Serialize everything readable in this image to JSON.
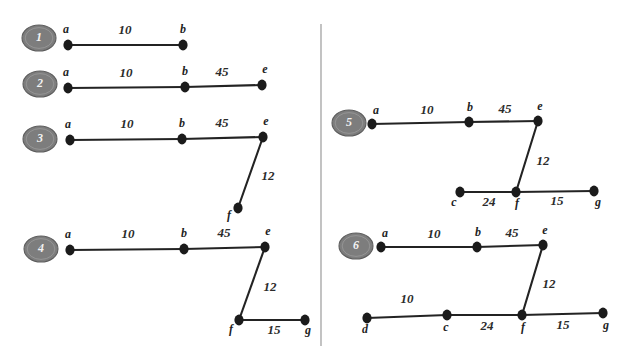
{
  "figure": {
    "background_color": "#ffffff",
    "edge_color": "#232323",
    "node_color": "#1b1b1b",
    "badge_fill": "#7d7d7d",
    "badge_text_color": "#f2f2f2",
    "divider_color": "#9a9a9a"
  },
  "divider": {
    "x": 321,
    "y1": 24,
    "y2": 346
  },
  "panels": [
    {
      "id": "panel-1",
      "badge": {
        "label": "1",
        "cx": 39,
        "cy": 38,
        "rx": 17,
        "ry": 13
      },
      "nodes": [
        {
          "id": "a",
          "label": "a",
          "x": 68,
          "y": 45,
          "label_dx": -2,
          "label_dy": -12
        },
        {
          "id": "b",
          "label": "b",
          "x": 183,
          "y": 45,
          "label_dx": 0,
          "label_dy": -12
        }
      ],
      "edges": [
        {
          "from": "a",
          "to": "b",
          "weight": "10",
          "label_x": 125,
          "label_y": 34
        }
      ]
    },
    {
      "id": "panel-2",
      "badge": {
        "label": "2",
        "cx": 40,
        "cy": 84,
        "rx": 17,
        "ry": 13
      },
      "nodes": [
        {
          "id": "a",
          "label": "a",
          "x": 68,
          "y": 88,
          "label_dx": -2,
          "label_dy": -12
        },
        {
          "id": "b",
          "label": "b",
          "x": 185,
          "y": 87,
          "label_dx": 0,
          "label_dy": -12
        },
        {
          "id": "e",
          "label": "e",
          "x": 262,
          "y": 85,
          "label_dx": 3,
          "label_dy": -12
        }
      ],
      "edges": [
        {
          "from": "a",
          "to": "b",
          "weight": "10",
          "label_x": 126,
          "label_y": 77
        },
        {
          "from": "b",
          "to": "e",
          "weight": "45",
          "label_x": 222,
          "label_y": 76
        }
      ]
    },
    {
      "id": "panel-3",
      "badge": {
        "label": "3",
        "cx": 40,
        "cy": 139,
        "rx": 17,
        "ry": 13
      },
      "nodes": [
        {
          "id": "a",
          "label": "a",
          "x": 70,
          "y": 140,
          "label_dx": -2,
          "label_dy": -12
        },
        {
          "id": "b",
          "label": "b",
          "x": 182,
          "y": 139,
          "label_dx": 0,
          "label_dy": -12
        },
        {
          "id": "e",
          "label": "e",
          "x": 263,
          "y": 137,
          "label_dx": 3,
          "label_dy": -12
        },
        {
          "id": "f",
          "label": "f",
          "x": 238,
          "y": 208,
          "label_dx": -9,
          "label_dy": 11
        }
      ],
      "edges": [
        {
          "from": "a",
          "to": "b",
          "weight": "10",
          "label_x": 127,
          "label_y": 128
        },
        {
          "from": "b",
          "to": "e",
          "weight": "45",
          "label_x": 222,
          "label_y": 127
        },
        {
          "from": "e",
          "to": "f",
          "weight": "12",
          "label_x": 268,
          "label_y": 180
        }
      ]
    },
    {
      "id": "panel-4",
      "badge": {
        "label": "4",
        "cx": 41,
        "cy": 249,
        "rx": 17,
        "ry": 13
      },
      "nodes": [
        {
          "id": "a",
          "label": "a",
          "x": 70,
          "y": 250,
          "label_dx": -2,
          "label_dy": -12
        },
        {
          "id": "b",
          "label": "b",
          "x": 184,
          "y": 249,
          "label_dx": 0,
          "label_dy": -12
        },
        {
          "id": "e",
          "label": "e",
          "x": 265,
          "y": 247,
          "label_dx": 3,
          "label_dy": -12
        },
        {
          "id": "f",
          "label": "f",
          "x": 239,
          "y": 320,
          "label_dx": -8,
          "label_dy": 13
        },
        {
          "id": "g",
          "label": "g",
          "x": 305,
          "y": 320,
          "label_dx": 3,
          "label_dy": 14
        }
      ],
      "edges": [
        {
          "from": "a",
          "to": "b",
          "weight": "10",
          "label_x": 128,
          "label_y": 238
        },
        {
          "from": "b",
          "to": "e",
          "weight": "45",
          "label_x": 224,
          "label_y": 237
        },
        {
          "from": "e",
          "to": "f",
          "weight": "12",
          "label_x": 270,
          "label_y": 291
        },
        {
          "from": "f",
          "to": "g",
          "weight": "15",
          "label_x": 274,
          "label_y": 334
        }
      ]
    },
    {
      "id": "panel-5",
      "badge": {
        "label": "5",
        "cx": 349,
        "cy": 123,
        "rx": 17,
        "ry": 13
      },
      "nodes": [
        {
          "id": "a",
          "label": "a",
          "x": 372,
          "y": 124,
          "label_dx": 4,
          "label_dy": -10
        },
        {
          "id": "b",
          "label": "b",
          "x": 469,
          "y": 122,
          "label_dx": 1,
          "label_dy": -11
        },
        {
          "id": "e",
          "label": "e",
          "x": 538,
          "y": 121,
          "label_dx": 2,
          "label_dy": -11
        },
        {
          "id": "c",
          "label": "c",
          "x": 460,
          "y": 192,
          "label_dx": -6,
          "label_dy": 14
        },
        {
          "id": "f",
          "label": "f",
          "x": 516,
          "y": 192,
          "label_dx": 1,
          "label_dy": 15
        },
        {
          "id": "g",
          "label": "g",
          "x": 594,
          "y": 191,
          "label_dx": 4,
          "label_dy": 15
        }
      ],
      "edges": [
        {
          "from": "a",
          "to": "b",
          "weight": "10",
          "label_x": 427,
          "label_y": 114
        },
        {
          "from": "b",
          "to": "e",
          "weight": "45",
          "label_x": 505,
          "label_y": 113
        },
        {
          "from": "e",
          "to": "f",
          "weight": "12",
          "label_x": 543,
          "label_y": 165
        },
        {
          "from": "c",
          "to": "f",
          "weight": "24",
          "label_x": 489,
          "label_y": 206
        },
        {
          "from": "f",
          "to": "g",
          "weight": "15",
          "label_x": 557,
          "label_y": 205
        }
      ]
    },
    {
      "id": "panel-6",
      "badge": {
        "label": "6",
        "cx": 356,
        "cy": 246,
        "rx": 17,
        "ry": 13
      },
      "nodes": [
        {
          "id": "a",
          "label": "a",
          "x": 381,
          "y": 247,
          "label_dx": 4,
          "label_dy": -10
        },
        {
          "id": "b",
          "label": "b",
          "x": 477,
          "y": 247,
          "label_dx": 1,
          "label_dy": -11
        },
        {
          "id": "e",
          "label": "e",
          "x": 543,
          "y": 245,
          "label_dx": 2,
          "label_dy": -11
        },
        {
          "id": "d",
          "label": "d",
          "x": 367,
          "y": 318,
          "label_dx": -2,
          "label_dy": 15
        },
        {
          "id": "c",
          "label": "c",
          "x": 447,
          "y": 315,
          "label_dx": -1,
          "label_dy": 16
        },
        {
          "id": "f",
          "label": "f",
          "x": 522,
          "y": 315,
          "label_dx": 1,
          "label_dy": 16
        },
        {
          "id": "g",
          "label": "g",
          "x": 603,
          "y": 313,
          "label_dx": 3,
          "label_dy": 16
        }
      ],
      "edges": [
        {
          "from": "a",
          "to": "b",
          "weight": "10",
          "label_x": 434,
          "label_y": 238
        },
        {
          "from": "b",
          "to": "e",
          "weight": "45",
          "label_x": 512,
          "label_y": 237
        },
        {
          "from": "e",
          "to": "f",
          "weight": "12",
          "label_x": 549,
          "label_y": 288
        },
        {
          "from": "d",
          "to": "c",
          "weight": "10",
          "label_x": 407,
          "label_y": 303
        },
        {
          "from": "c",
          "to": "f",
          "weight": "24",
          "label_x": 487,
          "label_y": 330
        },
        {
          "from": "f",
          "to": "g",
          "weight": "15",
          "label_x": 563,
          "label_y": 329
        }
      ]
    }
  ]
}
